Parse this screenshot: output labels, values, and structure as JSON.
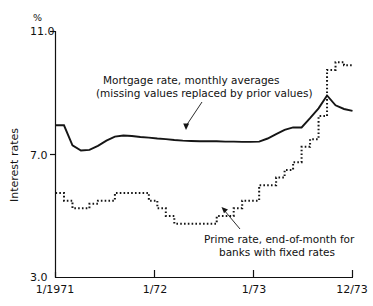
{
  "chart_data": {
    "type": "line",
    "title": "",
    "subtitle": "",
    "xlabel": "",
    "ylabel": "Interest rates",
    "unit_label": "%",
    "ylim": [
      3.0,
      11.0
    ],
    "xlim": [
      "1/1971",
      "12/73"
    ],
    "grid": false,
    "legend_position": "inline-annotations",
    "y_ticks": [
      "11.0",
      "7.0",
      "3.0"
    ],
    "y_tick_values": [
      11.0,
      7.0,
      3.0
    ],
    "x_ticks": [
      "1/1971",
      "1/72",
      "1/73",
      "12/73"
    ],
    "x_tick_values": [
      0,
      12,
      24,
      35
    ],
    "series": [
      {
        "name": "Mortgage rate, monthly averages (missing values replaced by prior values)",
        "style": "solid",
        "x": [
          0,
          1,
          2,
          3,
          4,
          5,
          6,
          7,
          8,
          9,
          10,
          11,
          12,
          13,
          14,
          15,
          16,
          17,
          18,
          19,
          20,
          21,
          22,
          23,
          24,
          25,
          26,
          27,
          28,
          29,
          30,
          31,
          32,
          33,
          34,
          35
        ],
        "values": [
          7.95,
          7.95,
          7.3,
          7.13,
          7.15,
          7.28,
          7.45,
          7.58,
          7.62,
          7.6,
          7.57,
          7.55,
          7.52,
          7.5,
          7.47,
          7.45,
          7.44,
          7.43,
          7.43,
          7.43,
          7.42,
          7.42,
          7.41,
          7.41,
          7.42,
          7.52,
          7.66,
          7.8,
          7.88,
          7.88,
          8.18,
          8.5,
          8.92,
          8.6,
          8.48,
          8.42
        ]
      },
      {
        "name": "Prime rate, end-of-month for banks with fixed rates",
        "style": "dotted",
        "x": [
          0,
          1,
          2,
          3,
          4,
          5,
          6,
          7,
          8,
          9,
          10,
          11,
          12,
          13,
          14,
          15,
          16,
          17,
          18,
          19,
          20,
          21,
          22,
          23,
          24,
          25,
          26,
          27,
          28,
          29,
          30,
          31,
          32,
          33,
          34,
          35
        ],
        "values": [
          5.75,
          5.5,
          5.25,
          5.25,
          5.4,
          5.5,
          5.5,
          5.75,
          5.75,
          5.75,
          5.75,
          5.5,
          5.25,
          5.0,
          4.75,
          4.75,
          4.75,
          4.75,
          4.75,
          5.0,
          5.0,
          5.25,
          5.5,
          5.5,
          6.0,
          6.0,
          6.25,
          6.5,
          6.75,
          7.25,
          7.5,
          8.25,
          9.75,
          10.0,
          9.9,
          9.9
        ]
      }
    ],
    "annotations": [
      {
        "id": "mortgage-annotation",
        "lines": [
          "Mortgage rate, monthly averages",
          "(missing values replaced by prior values)"
        ],
        "target_x": 18,
        "target_y": 7.43
      },
      {
        "id": "prime-annotation",
        "lines": [
          "Prime rate, end-of-month for",
          "banks with fixed rates"
        ],
        "target_x": 24,
        "target_y": 6.0
      }
    ]
  },
  "colors": {
    "ink": "#151515",
    "axis": "#111111",
    "background": "#ffffff"
  }
}
